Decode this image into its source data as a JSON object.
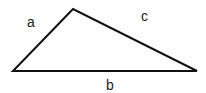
{
  "diagram": {
    "type": "triangle",
    "vertices": {
      "left": [
        13,
        71
      ],
      "top": [
        73,
        9
      ],
      "right": [
        197,
        71
      ]
    },
    "stroke_color": "#111111",
    "labels": {
      "a": "a",
      "b": "b",
      "c": "c"
    }
  }
}
